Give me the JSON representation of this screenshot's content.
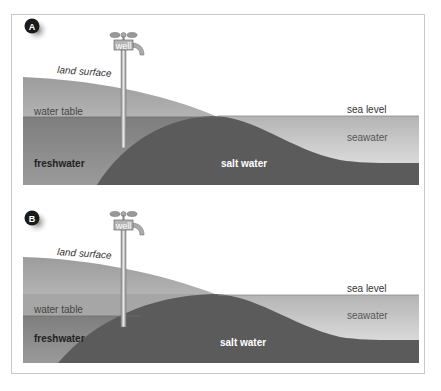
{
  "panels": [
    {
      "id": "A",
      "badge": "A",
      "well_label": "well",
      "labels": {
        "land_surface": "land surface",
        "water_table": "water table",
        "sea_level": "sea level",
        "seawater": "seawater",
        "freshwater": "freshwater",
        "salt_water": "salt water"
      }
    },
    {
      "id": "B",
      "badge": "B",
      "well_label": "well",
      "labels": {
        "land_surface": "land surface",
        "water_table": "water table",
        "sea_level": "sea level",
        "seawater": "seawater",
        "freshwater": "freshwater",
        "salt_water": "salt water"
      }
    }
  ],
  "colors": {
    "land": "#a9a9a9",
    "freshwater": "#8e8e8e",
    "salt_water": "#5a5a5a",
    "seawater_light": "#e6e6e6",
    "seawater_dark": "#b8b8b8",
    "badge": "#1a1a1a",
    "frame": "#c8c8c8"
  }
}
